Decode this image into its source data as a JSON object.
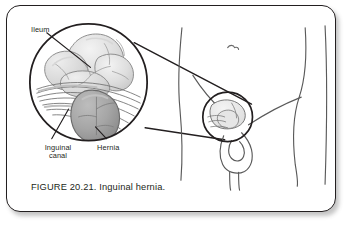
{
  "figure": {
    "caption": "FIGURE 20.21. Inguinal hernia.",
    "labels": {
      "ileum": "Ileum",
      "inguinal_canal": "Inguinal\ncanal",
      "hernia": "Hernia"
    },
    "icons": {
      "magnified_inset": "magnifier-circle-icon",
      "body_outline": "human-groin-outline-icon",
      "navel": "navel-mark-icon",
      "hernia_site_marker": "hernia-site-circle-icon",
      "leader_line": "leader-line-icon",
      "magnification_cone": "magnification-cone-icon"
    },
    "colors": {
      "ink": "#231f20",
      "card_background": "#ffffff",
      "page_background": "#ffffff",
      "border": "#231f20",
      "intestine_fill": "#d9d9d9",
      "intestine_highlight": "#efefef",
      "hernia_sac_fill": "#a9a9a9",
      "hernia_sac_shade": "#8f8f8f",
      "canal_stria": "#6f6f6f",
      "body_outline": "#4a4a4a"
    }
  }
}
